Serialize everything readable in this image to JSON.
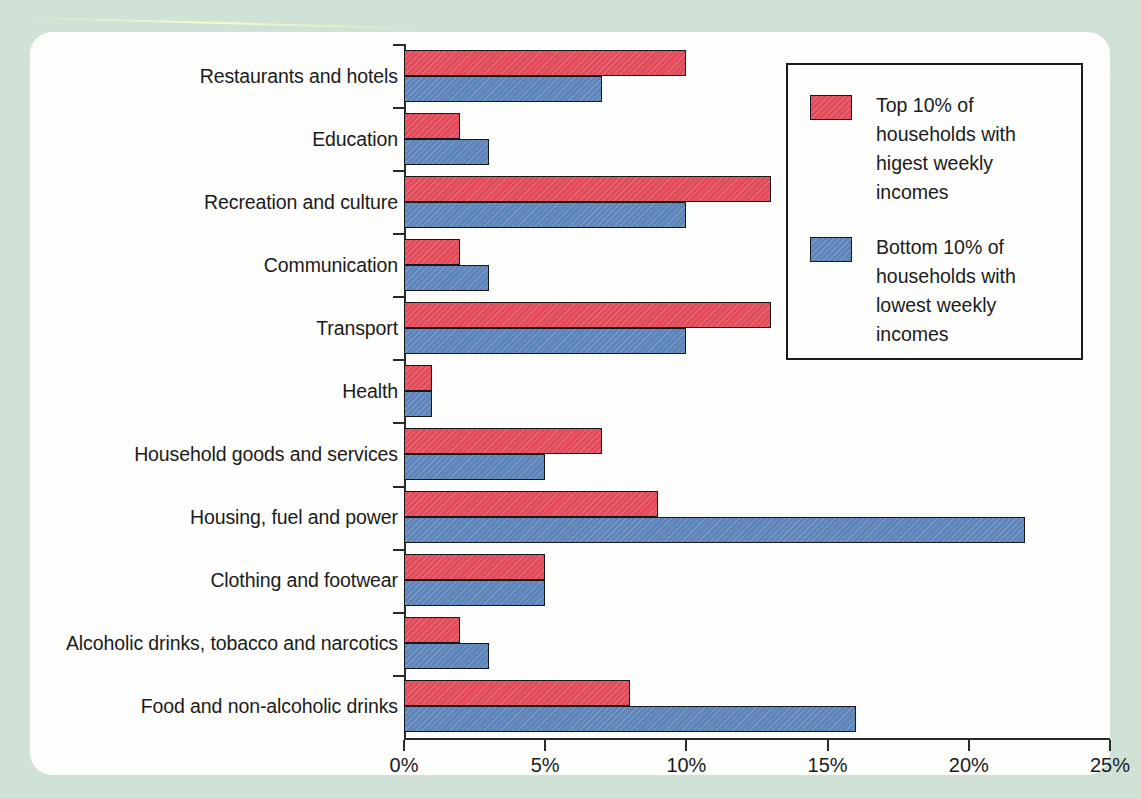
{
  "theme": {
    "page_background": "#cfe2d5",
    "card_background": "#fdfdfb",
    "axis_color": "#2a2a2a",
    "top_color": "#e24b5a",
    "bottom_color": "#5e85b9"
  },
  "legend": {
    "position": "top-right",
    "entries": [
      {
        "swatch": "#e24b5a",
        "label": "Top 10% of households with higest weekly incomes"
      },
      {
        "swatch": "#5e85b9",
        "label": "Bottom 10% of households with lowest weekly incomes"
      }
    ]
  },
  "chart_data": {
    "type": "bar",
    "orientation": "horizontal",
    "title": "",
    "subtitle": "",
    "xlabel": "",
    "ylabel": "",
    "xlim": [
      0,
      25
    ],
    "xtick_labels": [
      "0%",
      "5%",
      "10%",
      "15%",
      "20%",
      "25%"
    ],
    "xtick_values": [
      0,
      5,
      10,
      15,
      20,
      25
    ],
    "grid": false,
    "legend_position": "top-right",
    "value_unit": "%",
    "categories": [
      "Restaurants and hotels",
      "Education",
      "Recreation and culture",
      "Communication",
      "Transport",
      "Health",
      "Household goods and services",
      "Housing, fuel and power",
      "Clothing and footwear",
      "Alcoholic drinks, tobacco and narcotics",
      "Food and non-alcoholic drinks"
    ],
    "series": [
      {
        "name": "Top 10% of households with higest weekly incomes",
        "color": "#e24b5a",
        "values": [
          10,
          2,
          13,
          2,
          13,
          1,
          7,
          9,
          5,
          2,
          8
        ]
      },
      {
        "name": "Bottom 10% of households with lowest weekly incomes",
        "color": "#5e85b9",
        "values": [
          7,
          3,
          10,
          3,
          10,
          1,
          5,
          22,
          5,
          3,
          16
        ]
      }
    ]
  }
}
